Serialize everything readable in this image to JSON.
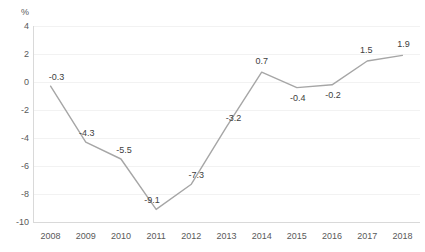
{
  "chart_data": {
    "type": "line",
    "title": "",
    "subtitle": "",
    "xlabel": "",
    "ylabel": "",
    "unit_label": "%",
    "categories": [
      "2008",
      "2009",
      "2010",
      "2011",
      "2012",
      "2013",
      "2014",
      "2015",
      "2016",
      "2017",
      "2018"
    ],
    "values": [
      -0.3,
      -4.3,
      -5.5,
      -9.1,
      -7.3,
      -3.2,
      0.7,
      -0.4,
      -0.2,
      1.5,
      1.9
    ],
    "data_labels": [
      "-0.3",
      "-4.3",
      "-5.5",
      "-9.1",
      "-7.3",
      "-3.2",
      "0.7",
      "-0.4",
      "-0.2",
      "1.5",
      "1.9"
    ],
    "ylim": [
      -10,
      4
    ],
    "ytick_values": [
      4,
      2,
      0,
      -2,
      -4,
      -6,
      -8,
      -10
    ],
    "ytick_labels": [
      "4",
      "2",
      "0",
      "-2",
      "-4",
      "-6",
      "-8",
      "-10"
    ],
    "grid": true,
    "grid_axis": "y",
    "legend": false,
    "legend_position": "none",
    "series": [
      {
        "name": "",
        "values": [
          -0.3,
          -4.3,
          -5.5,
          -9.1,
          -7.3,
          -3.2,
          0.7,
          -0.4,
          -0.2,
          1.5,
          1.9
        ]
      }
    ],
    "colors": {
      "line": "#a6a6a6",
      "grid": "#f2f2f2",
      "axis": "#d9d9d9",
      "tick_text": "#595959",
      "data_label_text": "#404040",
      "background": "#ffffff"
    },
    "label_offsets": [
      {
        "dx": 6,
        "dy": -9
      },
      {
        "dx": 1,
        "dy": -9
      },
      {
        "dx": 3,
        "dy": -9
      },
      {
        "dx": -4,
        "dy": -9
      },
      {
        "dx": 5,
        "dy": -9
      },
      {
        "dx": 7,
        "dy": -9
      },
      {
        "dx": 0,
        "dy": -11
      },
      {
        "dx": 1,
        "dy": 10
      },
      {
        "dx": 1,
        "dy": 10
      },
      {
        "dx": -1,
        "dy": -11
      },
      {
        "dx": 1,
        "dy": -11
      }
    ]
  }
}
